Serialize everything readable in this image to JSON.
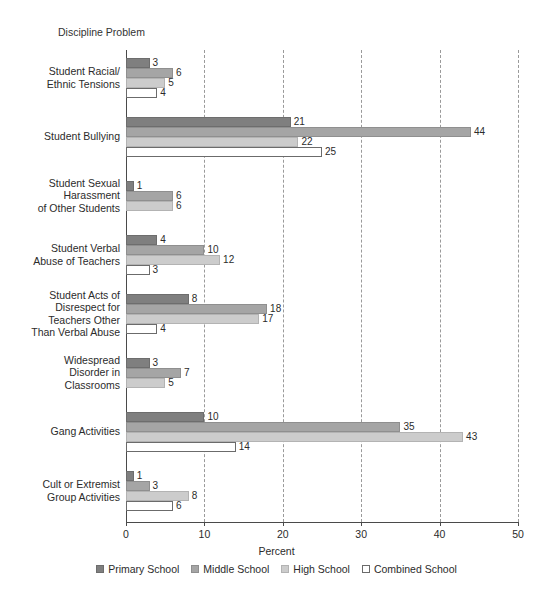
{
  "chart_data": {
    "type": "bar",
    "orientation": "horizontal",
    "title": "",
    "xlabel": "Percent",
    "ylabel": "Discipline Problem",
    "xlim": [
      0,
      50
    ],
    "xticks": [
      0,
      10,
      20,
      30,
      40,
      50
    ],
    "grid": "vertical-dashed",
    "legend_position": "bottom",
    "categories": [
      "Student Racial/\nEthnic Tensions",
      "Student Bullying",
      "Student Sexual\nHarassment\nof Other Students",
      "Student Verbal\nAbuse of Teachers",
      "Student Acts of\nDisrespect for\nTeachers Other\nThan Verbal Abuse",
      "Widespread\nDisorder in\nClassrooms",
      "Gang Activities",
      "Cult or Extremist\nGroup Activities"
    ],
    "category_lines": [
      [
        "Student Racial/",
        "Ethnic Tensions"
      ],
      [
        "Student Bullying"
      ],
      [
        "Student Sexual",
        "Harassment",
        "of Other Students"
      ],
      [
        "Student Verbal",
        "Abuse of Teachers"
      ],
      [
        "Student Acts of",
        "Disrespect for",
        "Teachers Other",
        "Than Verbal Abuse"
      ],
      [
        "Widespread",
        "Disorder in",
        "Classrooms"
      ],
      [
        "Gang Activities"
      ],
      [
        "Cult or Extremist",
        "Group Activities"
      ]
    ],
    "series": [
      {
        "name": "Primary School",
        "color": "#7f7f7f",
        "values": [
          3,
          21,
          1,
          4,
          8,
          3,
          10,
          1
        ]
      },
      {
        "name": "Middle School",
        "color": "#a5a5a5",
        "values": [
          6,
          44,
          6,
          10,
          18,
          7,
          35,
          3
        ]
      },
      {
        "name": "High School",
        "color": "#cccccc",
        "values": [
          5,
          22,
          6,
          12,
          17,
          5,
          43,
          8
        ]
      },
      {
        "name": "Combined School",
        "color": "#ffffff",
        "values": [
          4,
          25,
          null,
          3,
          4,
          null,
          14,
          6
        ]
      }
    ]
  },
  "legend": {
    "items": [
      {
        "label": "Primary School",
        "swatch": "legend-swatch-primary"
      },
      {
        "label": "Middle School",
        "swatch": "legend-swatch-middle"
      },
      {
        "label": "High School",
        "swatch": "legend-swatch-high"
      },
      {
        "label": "Combined School",
        "swatch": "legend-swatch-combined"
      }
    ]
  }
}
